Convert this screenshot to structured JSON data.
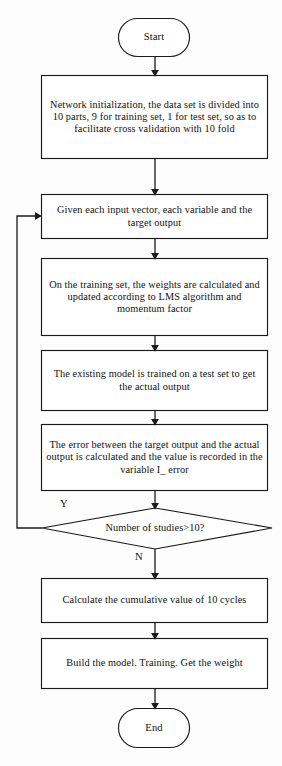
{
  "diagram": {
    "stroke_color": "#1a1a1a",
    "background_color": "#fdfdfd",
    "text_color": "#111111"
  },
  "nodes": {
    "start": {
      "label": "Start",
      "shape": "terminator"
    },
    "init": {
      "label": "Network initialization, the data set is divided into 10 parts, 9 for training set, 1 for test set, so as to facilitate cross validation with 10 fold",
      "shape": "process"
    },
    "given": {
      "label": "Given each input vector, each variable and the target output",
      "shape": "process"
    },
    "weights": {
      "label": "On the training set, the weights are calculated and updated according to LMS algorithm and momentum factor",
      "shape": "process"
    },
    "trained": {
      "label": "The existing model is trained on a test set to get the actual output",
      "shape": "process"
    },
    "error": {
      "label": "The error between the target output and the actual output is calculated and the value is recorded in the variable I_ error",
      "shape": "process"
    },
    "decision": {
      "label": "Number of studies>10?",
      "shape": "decision"
    },
    "cumulative": {
      "label": "Calculate the cumulative value of 10 cycles",
      "shape": "process"
    },
    "build": {
      "label": "Build the model. Training. Get the weight",
      "shape": "process"
    },
    "end": {
      "label": "End",
      "shape": "terminator"
    }
  },
  "edge_labels": {
    "yes": "Y",
    "no": "N"
  }
}
